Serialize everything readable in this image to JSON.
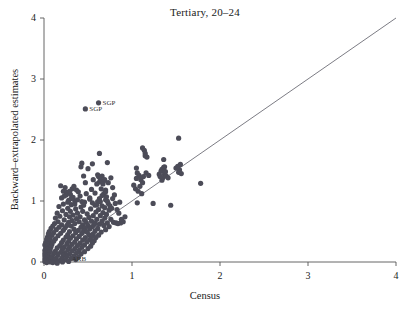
{
  "chart_data": {
    "type": "scatter",
    "title": "Tertiary, 20–24",
    "xlabel": "Census",
    "ylabel": "Backward–extrapolated estimates",
    "xlim": [
      0,
      4
    ],
    "ylim": [
      0,
      4
    ],
    "xticks": [
      0,
      1,
      2,
      3,
      4
    ],
    "yticks": [
      0,
      1,
      2,
      3,
      4
    ],
    "xticklabels": [
      "0",
      "1",
      "2",
      "3",
      "4"
    ],
    "yticklabels": [
      "0",
      "1",
      "2",
      "3",
      "4"
    ],
    "grid": false,
    "legend": null,
    "point_color": "#4c4c58",
    "line_color": "#5a5a64",
    "axis_color": "#555555",
    "reference_line": {
      "label": "y = x",
      "from": [
        0,
        0
      ],
      "to": [
        4,
        4
      ]
    },
    "annotations": [
      {
        "text": "SGP",
        "x": 0.47,
        "y": 2.51
      },
      {
        "text": "SGP",
        "x": 0.62,
        "y": 2.61
      },
      {
        "text": "ARB",
        "x": 0.27,
        "y": 0.05
      }
    ],
    "points": [
      [
        0.47,
        2.51
      ],
      [
        0.62,
        2.61
      ],
      [
        1.53,
        2.03
      ],
      [
        1.12,
        1.87
      ],
      [
        1.14,
        1.83
      ],
      [
        1.15,
        1.78
      ],
      [
        0.63,
        1.78
      ],
      [
        1.15,
        1.74
      ],
      [
        1.17,
        1.72
      ],
      [
        1.36,
        1.68
      ],
      [
        0.72,
        1.63
      ],
      [
        0.43,
        1.62
      ],
      [
        0.55,
        1.61
      ],
      [
        1.55,
        1.6
      ],
      [
        0.42,
        1.56
      ],
      [
        1.37,
        1.56
      ],
      [
        1.36,
        1.55
      ],
      [
        1.05,
        1.54
      ],
      [
        0.5,
        1.53
      ],
      [
        1.34,
        1.52
      ],
      [
        1.54,
        1.51
      ],
      [
        1.36,
        1.5
      ],
      [
        1.33,
        1.49
      ],
      [
        1.53,
        1.47
      ],
      [
        1.06,
        1.46
      ],
      [
        1.37,
        1.44
      ],
      [
        0.61,
        1.43
      ],
      [
        1.08,
        1.42
      ],
      [
        0.66,
        1.41
      ],
      [
        0.45,
        1.41
      ],
      [
        0.62,
        1.4
      ],
      [
        1.35,
        1.38
      ],
      [
        1.05,
        1.37
      ],
      [
        0.64,
        1.36
      ],
      [
        1.1,
        1.35
      ],
      [
        1.34,
        1.34
      ],
      [
        0.68,
        1.33
      ],
      [
        0.63,
        1.31
      ],
      [
        1.12,
        1.3
      ],
      [
        1.78,
        1.29
      ],
      [
        0.67,
        1.28
      ],
      [
        0.19,
        1.25
      ],
      [
        1.09,
        1.24
      ],
      [
        0.24,
        1.22
      ],
      [
        0.32,
        1.2
      ],
      [
        0.54,
        1.19
      ],
      [
        0.7,
        1.18
      ],
      [
        0.22,
        1.16
      ],
      [
        0.39,
        1.15
      ],
      [
        0.26,
        1.14
      ],
      [
        0.58,
        1.13
      ],
      [
        0.68,
        1.12
      ],
      [
        0.3,
        1.11
      ],
      [
        0.25,
        1.1
      ],
      [
        0.66,
        1.09
      ],
      [
        0.71,
        1.07
      ],
      [
        0.33,
        1.06
      ],
      [
        0.2,
        1.05
      ],
      [
        0.63,
        1.04
      ],
      [
        0.52,
        1.03
      ],
      [
        0.7,
        1.02
      ],
      [
        0.28,
        1.01
      ],
      [
        0.35,
        1.0
      ],
      [
        0.61,
        0.99
      ],
      [
        0.46,
        0.98
      ],
      [
        1.06,
        0.97
      ],
      [
        1.24,
        0.96
      ],
      [
        0.73,
        0.96
      ],
      [
        1.44,
        0.93
      ],
      [
        0.22,
        0.95
      ],
      [
        0.31,
        0.94
      ],
      [
        0.58,
        0.93
      ],
      [
        0.66,
        0.92
      ],
      [
        0.17,
        0.91
      ],
      [
        0.42,
        0.9
      ],
      [
        0.69,
        0.89
      ],
      [
        0.27,
        0.88
      ],
      [
        0.36,
        0.87
      ],
      [
        0.53,
        0.87
      ],
      [
        0.62,
        0.86
      ],
      [
        0.74,
        0.85
      ],
      [
        0.21,
        0.84
      ],
      [
        0.44,
        0.83
      ],
      [
        0.3,
        0.83
      ],
      [
        0.59,
        0.82
      ],
      [
        0.67,
        0.81
      ],
      [
        0.15,
        0.8
      ],
      [
        0.38,
        0.8
      ],
      [
        0.49,
        0.79
      ],
      [
        0.71,
        0.78
      ],
      [
        0.25,
        0.78
      ],
      [
        0.33,
        0.77
      ],
      [
        0.56,
        0.76
      ],
      [
        0.64,
        0.76
      ],
      [
        0.18,
        0.75
      ],
      [
        0.41,
        0.74
      ],
      [
        0.29,
        0.74
      ],
      [
        0.51,
        0.73
      ],
      [
        0.69,
        0.72
      ],
      [
        0.13,
        0.72
      ],
      [
        0.37,
        0.71
      ],
      [
        0.6,
        0.7
      ],
      [
        0.76,
        0.7
      ],
      [
        0.23,
        0.69
      ],
      [
        0.46,
        0.69
      ],
      [
        0.32,
        0.68
      ],
      [
        0.54,
        0.67
      ],
      [
        0.66,
        0.67
      ],
      [
        0.16,
        0.66
      ],
      [
        0.4,
        0.66
      ],
      [
        0.28,
        0.65
      ],
      [
        0.48,
        0.65
      ],
      [
        0.72,
        0.64
      ],
      [
        0.82,
        0.64
      ],
      [
        0.87,
        0.64
      ],
      [
        0.12,
        0.63
      ],
      [
        0.35,
        0.63
      ],
      [
        0.57,
        0.62
      ],
      [
        0.63,
        0.62
      ],
      [
        0.2,
        0.61
      ],
      [
        0.44,
        0.61
      ],
      [
        0.26,
        0.6
      ],
      [
        0.5,
        0.6
      ],
      [
        0.68,
        0.6
      ],
      [
        0.1,
        0.59
      ],
      [
        0.31,
        0.59
      ],
      [
        0.55,
        0.58
      ],
      [
        0.74,
        0.58
      ],
      [
        0.17,
        0.57
      ],
      [
        0.42,
        0.57
      ],
      [
        0.24,
        0.56
      ],
      [
        0.47,
        0.56
      ],
      [
        0.61,
        0.55
      ],
      [
        0.08,
        0.55
      ],
      [
        0.34,
        0.54
      ],
      [
        0.52,
        0.54
      ],
      [
        0.7,
        0.53
      ],
      [
        0.14,
        0.53
      ],
      [
        0.39,
        0.52
      ],
      [
        0.22,
        0.52
      ],
      [
        0.45,
        0.51
      ],
      [
        0.58,
        0.51
      ],
      [
        0.06,
        0.5
      ],
      [
        0.29,
        0.5
      ],
      [
        0.49,
        0.49
      ],
      [
        0.65,
        0.49
      ],
      [
        0.11,
        0.48
      ],
      [
        0.36,
        0.48
      ],
      [
        0.19,
        0.47
      ],
      [
        0.43,
        0.47
      ],
      [
        0.56,
        0.46
      ],
      [
        0.05,
        0.46
      ],
      [
        0.27,
        0.45
      ],
      [
        0.51,
        0.45
      ],
      [
        0.62,
        0.44
      ],
      [
        0.09,
        0.44
      ],
      [
        0.33,
        0.43
      ],
      [
        0.16,
        0.43
      ],
      [
        0.4,
        0.42
      ],
      [
        0.54,
        0.42
      ],
      [
        0.04,
        0.41
      ],
      [
        0.25,
        0.41
      ],
      [
        0.47,
        0.4
      ],
      [
        0.59,
        0.4
      ],
      [
        0.07,
        0.39
      ],
      [
        0.3,
        0.39
      ],
      [
        0.13,
        0.38
      ],
      [
        0.37,
        0.38
      ],
      [
        0.52,
        0.37
      ],
      [
        0.03,
        0.37
      ],
      [
        0.22,
        0.36
      ],
      [
        0.44,
        0.36
      ],
      [
        0.57,
        0.35
      ],
      [
        0.06,
        0.35
      ],
      [
        0.28,
        0.34
      ],
      [
        0.11,
        0.34
      ],
      [
        0.35,
        0.33
      ],
      [
        0.49,
        0.33
      ],
      [
        0.02,
        0.32
      ],
      [
        0.2,
        0.32
      ],
      [
        0.41,
        0.31
      ],
      [
        0.55,
        0.31
      ],
      [
        0.05,
        0.3
      ],
      [
        0.26,
        0.3
      ],
      [
        0.09,
        0.29
      ],
      [
        0.32,
        0.29
      ],
      [
        0.46,
        0.28
      ],
      [
        0.01,
        0.28
      ],
      [
        0.18,
        0.27
      ],
      [
        0.38,
        0.27
      ],
      [
        0.53,
        0.26
      ],
      [
        0.04,
        0.26
      ],
      [
        0.23,
        0.25
      ],
      [
        0.08,
        0.25
      ],
      [
        0.29,
        0.24
      ],
      [
        0.43,
        0.24
      ],
      [
        0.02,
        0.23
      ],
      [
        0.15,
        0.23
      ],
      [
        0.35,
        0.22
      ],
      [
        0.5,
        0.22
      ],
      [
        0.03,
        0.21
      ],
      [
        0.21,
        0.21
      ],
      [
        0.07,
        0.2
      ],
      [
        0.27,
        0.2
      ],
      [
        0.4,
        0.19
      ],
      [
        0.01,
        0.19
      ],
      [
        0.13,
        0.18
      ],
      [
        0.32,
        0.18
      ],
      [
        0.46,
        0.17
      ],
      [
        0.02,
        0.17
      ],
      [
        0.19,
        0.16
      ],
      [
        0.06,
        0.16
      ],
      [
        0.24,
        0.15
      ],
      [
        0.37,
        0.15
      ],
      [
        0.01,
        0.14
      ],
      [
        0.11,
        0.14
      ],
      [
        0.29,
        0.13
      ],
      [
        0.42,
        0.13
      ],
      [
        0.03,
        0.12
      ],
      [
        0.16,
        0.12
      ],
      [
        0.05,
        0.11
      ],
      [
        0.22,
        0.11
      ],
      [
        0.34,
        0.1
      ],
      [
        0.01,
        0.1
      ],
      [
        0.09,
        0.09
      ],
      [
        0.26,
        0.09
      ],
      [
        0.39,
        0.08
      ],
      [
        0.02,
        0.08
      ],
      [
        0.14,
        0.07
      ],
      [
        0.04,
        0.07
      ],
      [
        0.2,
        0.06
      ],
      [
        0.31,
        0.06
      ],
      [
        0.01,
        0.05
      ],
      [
        0.08,
        0.05
      ],
      [
        0.24,
        0.04
      ],
      [
        0.36,
        0.04
      ],
      [
        0.02,
        0.03
      ],
      [
        0.12,
        0.03
      ],
      [
        0.05,
        0.02
      ],
      [
        0.17,
        0.02
      ],
      [
        0.28,
        0.01
      ],
      [
        0.01,
        0.01
      ],
      [
        0.07,
        0.0
      ],
      [
        0.21,
        0.0
      ],
      [
        0.03,
        -0.01
      ],
      [
        0.1,
        -0.01
      ],
      [
        0.15,
        -0.02
      ],
      [
        0.58,
        0.64
      ],
      [
        0.79,
        0.65
      ],
      [
        0.84,
        0.63
      ],
      [
        0.75,
        0.92
      ],
      [
        0.77,
        0.88
      ],
      [
        0.8,
        1.1
      ],
      [
        0.78,
        1.22
      ],
      [
        0.73,
        1.3
      ],
      [
        0.69,
        1.35
      ],
      [
        0.76,
        1.38
      ],
      [
        0.7,
        1.15
      ],
      [
        0.65,
        1.2
      ],
      [
        0.6,
        1.28
      ],
      [
        0.56,
        1.35
      ],
      [
        0.47,
        1.3
      ],
      [
        0.37,
        1.18
      ],
      [
        0.29,
        1.16
      ],
      [
        0.34,
        1.24
      ],
      [
        0.41,
        1.08
      ],
      [
        0.48,
        1.12
      ],
      [
        0.52,
        1.05
      ],
      [
        0.43,
        0.99
      ],
      [
        0.38,
        1.02
      ],
      [
        0.31,
        1.04
      ],
      [
        0.23,
        1.08
      ],
      [
        0.27,
        0.98
      ],
      [
        0.35,
        0.95
      ],
      [
        0.45,
        0.93
      ],
      [
        0.55,
        0.97
      ],
      [
        0.6,
        0.94
      ],
      [
        0.64,
        0.99
      ],
      [
        0.72,
        1.0
      ],
      [
        0.78,
        1.04
      ],
      [
        0.81,
        0.96
      ],
      [
        0.86,
        0.98
      ],
      [
        1.02,
        1.26
      ],
      [
        1.04,
        1.2
      ],
      [
        1.07,
        1.16
      ],
      [
        1.11,
        1.12
      ],
      [
        1.13,
        1.4
      ],
      [
        1.16,
        1.46
      ],
      [
        1.19,
        1.42
      ],
      [
        1.31,
        1.44
      ],
      [
        1.32,
        1.4
      ],
      [
        1.38,
        1.48
      ],
      [
        1.39,
        1.41
      ],
      [
        1.41,
        1.38
      ],
      [
        1.5,
        1.54
      ],
      [
        1.52,
        1.57
      ],
      [
        1.56,
        1.45
      ],
      [
        0.9,
        0.66
      ],
      [
        0.88,
        0.7
      ],
      [
        0.92,
        0.74
      ],
      [
        0.85,
        0.8
      ],
      [
        0.83,
        0.86
      ]
    ]
  }
}
